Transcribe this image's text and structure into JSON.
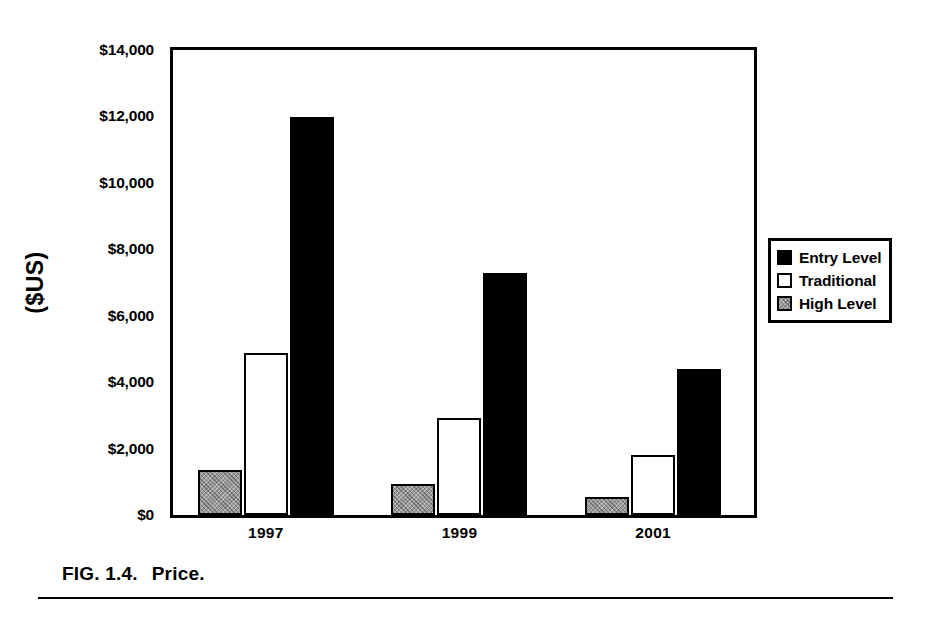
{
  "figure": {
    "caption_number": "FIG. 1.4.",
    "caption_text": "Price."
  },
  "legend": {
    "position": "right",
    "items": [
      {
        "label": "Entry Level",
        "swatch": "black",
        "color": "#000000"
      },
      {
        "label": "Traditional",
        "swatch": "white",
        "color": "#ffffff"
      },
      {
        "label": "High Level",
        "swatch": "gray",
        "color": "#9b9b9b"
      }
    ]
  },
  "chart_data": {
    "type": "bar",
    "title": "",
    "xlabel": "",
    "ylabel": "($US)",
    "categories": [
      "1997",
      "1999",
      "2001"
    ],
    "ylim": [
      0,
      14000
    ],
    "ytick_step": 2000,
    "ytick_labels": [
      "$0",
      "$2,000",
      "$4,000",
      "$6,000",
      "$8,000",
      "$10,000",
      "$12,000",
      "$14,000"
    ],
    "ytick_values": [
      0,
      2000,
      4000,
      6000,
      8000,
      10000,
      12000,
      14000
    ],
    "grid": false,
    "legend_position": "right",
    "series": [
      {
        "name": "High Level",
        "swatch": "gray",
        "values": [
          1370,
          920,
          540
        ]
      },
      {
        "name": "Traditional",
        "swatch": "white",
        "values": [
          4880,
          2920,
          1820
        ]
      },
      {
        "name": "Entry Level",
        "swatch": "black",
        "values": [
          11980,
          7280,
          4400
        ]
      }
    ]
  }
}
